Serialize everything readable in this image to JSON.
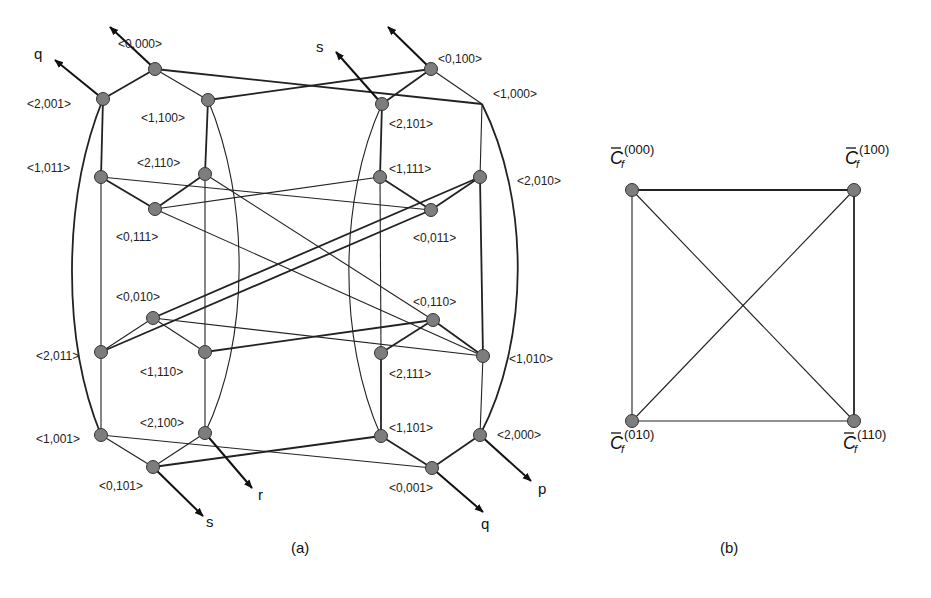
{
  "figure": {
    "panel_a": {
      "caption": "(a)",
      "nodes": [
        {
          "id": "n0000",
          "label": "<0,000>",
          "x": 155,
          "y": 69,
          "lx": 118,
          "ly": 48,
          "circle": true
        },
        {
          "id": "n0100",
          "label": "<0,100>",
          "x": 431,
          "y": 69,
          "lx": 438,
          "ly": 63,
          "circle": true
        },
        {
          "id": "n2001",
          "label": "<2,001>",
          "x": 103,
          "y": 99,
          "lx": 27,
          "ly": 108,
          "circle": true
        },
        {
          "id": "n1100",
          "label": "<1,100>",
          "x": 208,
          "y": 100,
          "lx": 141,
          "ly": 122,
          "circle": true
        },
        {
          "id": "n2101",
          "label": "<2,101>",
          "x": 382,
          "y": 104,
          "lx": 389,
          "ly": 128,
          "circle": true
        },
        {
          "id": "n1000",
          "label": "<1,000>",
          "x": 482,
          "y": 104,
          "lx": 493,
          "ly": 98,
          "circle": false
        },
        {
          "id": "n1011",
          "label": "<1,011>",
          "x": 101,
          "y": 177,
          "lx": 27,
          "ly": 172,
          "circle": true
        },
        {
          "id": "n2110",
          "label": "<2,110>",
          "x": 205,
          "y": 174,
          "lx": 137,
          "ly": 167,
          "circle": true
        },
        {
          "id": "n1111",
          "label": "<1,111>",
          "x": 380,
          "y": 177,
          "lx": 389,
          "ly": 173,
          "circle": true
        },
        {
          "id": "n2010",
          "label": "<2,010>",
          "x": 480,
          "y": 177,
          "lx": 517,
          "ly": 185,
          "circle": true
        },
        {
          "id": "n0111",
          "label": "<0,111>",
          "x": 155,
          "y": 209,
          "lx": 116,
          "ly": 241,
          "circle": true
        },
        {
          "id": "n0011",
          "label": "<0,011>",
          "x": 431,
          "y": 210,
          "lx": 413,
          "ly": 242,
          "circle": true
        },
        {
          "id": "n0010",
          "label": "<0,010>",
          "x": 153,
          "y": 318,
          "lx": 116,
          "ly": 301,
          "circle": true
        },
        {
          "id": "n0110",
          "label": "<0,110>",
          "x": 433,
          "y": 320,
          "lx": 413,
          "ly": 306,
          "circle": true
        },
        {
          "id": "n2011",
          "label": "<2,011>",
          "x": 101,
          "y": 352,
          "lx": 36,
          "ly": 360,
          "circle": true
        },
        {
          "id": "n1110",
          "label": "<1,110>",
          "x": 205,
          "y": 352,
          "lx": 140,
          "ly": 376,
          "circle": true
        },
        {
          "id": "n2111",
          "label": "<2,111>",
          "x": 381,
          "y": 353,
          "lx": 389,
          "ly": 378,
          "circle": true
        },
        {
          "id": "n1010",
          "label": "<1,010>",
          "x": 483,
          "y": 356,
          "lx": 509,
          "ly": 363,
          "circle": true
        },
        {
          "id": "n1001",
          "label": "<1,001>",
          "x": 101,
          "y": 435,
          "lx": 36,
          "ly": 443,
          "circle": true
        },
        {
          "id": "n2100",
          "label": "<2,100>",
          "x": 205,
          "y": 433,
          "lx": 140,
          "ly": 427,
          "circle": true
        },
        {
          "id": "n1101",
          "label": "<1,101>",
          "x": 381,
          "y": 436,
          "lx": 389,
          "ly": 432,
          "circle": true
        },
        {
          "id": "n2000",
          "label": "<2,000>",
          "x": 480,
          "y": 435,
          "lx": 497,
          "ly": 439,
          "circle": true
        },
        {
          "id": "n0101",
          "label": "<0,101>",
          "x": 153,
          "y": 467,
          "lx": 99,
          "ly": 490,
          "circle": true
        },
        {
          "id": "n0001",
          "label": "<0,001>",
          "x": 432,
          "y": 468,
          "lx": 389,
          "ly": 492,
          "circle": true
        }
      ],
      "edges": [
        [
          "n0000",
          "n2001",
          "thick"
        ],
        [
          "n0000",
          "n1100",
          "thin"
        ],
        [
          "n0000",
          "n1000",
          "thick"
        ],
        [
          "n0100",
          "n2101",
          "thick"
        ],
        [
          "n0100",
          "n1000",
          "thin"
        ],
        [
          "n0100",
          "n1100",
          "thick"
        ],
        [
          "n2001",
          "n1011",
          "thick"
        ],
        [
          "n1100",
          "n2110",
          "thick"
        ],
        [
          "n2101",
          "n1111",
          "thick"
        ],
        [
          "n1000",
          "n2010",
          "thin"
        ],
        [
          "n1011",
          "n0111",
          "thick"
        ],
        [
          "n2110",
          "n0111",
          "thick"
        ],
        [
          "n1011",
          "n0011",
          "thin"
        ],
        [
          "n0111",
          "n1111",
          "thin"
        ],
        [
          "n1111",
          "n0011",
          "thick"
        ],
        [
          "n2010",
          "n0011",
          "thick"
        ],
        [
          "n0111",
          "n1010",
          "thin"
        ],
        [
          "n2110",
          "n0110",
          "thin"
        ],
        [
          "n2010",
          "n0010",
          "thick"
        ],
        [
          "n0011",
          "n2011",
          "thick"
        ],
        [
          "n1011",
          "n2011",
          "thin"
        ],
        [
          "n2110",
          "n1110",
          "thin"
        ],
        [
          "n1111",
          "n2111",
          "thin"
        ],
        [
          "n2010",
          "n1010",
          "thick"
        ],
        [
          "n0010",
          "n2011",
          "thin"
        ],
        [
          "n0010",
          "n1110",
          "thin"
        ],
        [
          "n0010",
          "n1010",
          "thin"
        ],
        [
          "n1110",
          "n0110",
          "thick"
        ],
        [
          "n0110",
          "n2111",
          "thick"
        ],
        [
          "n0110",
          "n1010",
          "thick"
        ],
        [
          "n2011",
          "n1001",
          "thin"
        ],
        [
          "n1110",
          "n2100",
          "thin"
        ],
        [
          "n2111",
          "n1101",
          "thick"
        ],
        [
          "n1010",
          "n2000",
          "thin"
        ],
        [
          "n1001",
          "n0101",
          "thin"
        ],
        [
          "n2100",
          "n0101",
          "thin"
        ],
        [
          "n1001",
          "n0001",
          "thin"
        ],
        [
          "n0101",
          "n1101",
          "thick"
        ],
        [
          "n1101",
          "n0001",
          "thick"
        ],
        [
          "n2000",
          "n0001",
          "thick"
        ]
      ],
      "curves": [
        {
          "d": "M103,99 C62,200 62,340 101,435",
          "w": "thick"
        },
        {
          "d": "M208,100 C250,200 250,340 205,433",
          "w": "thin"
        },
        {
          "d": "M382,104 C338,200 338,340 381,436",
          "w": "thin"
        },
        {
          "d": "M482,104 C530,200 530,340 480,435",
          "w": "thick"
        }
      ],
      "arrows": [
        {
          "from": [
            155,
            69
          ],
          "to": [
            110,
            27
          ],
          "label": "",
          "lx": 0,
          "ly": 0
        },
        {
          "from": [
            103,
            99
          ],
          "to": [
            55,
            60
          ],
          "label": "q",
          "lx": 34,
          "ly": 59
        },
        {
          "from": [
            431,
            69
          ],
          "to": [
            388,
            27
          ],
          "label": "",
          "lx": 0,
          "ly": 0
        },
        {
          "from": [
            382,
            104
          ],
          "to": [
            336,
            52
          ],
          "label": "s",
          "lx": 316,
          "ly": 52
        },
        {
          "from": [
            205,
            433
          ],
          "to": [
            252,
            488
          ],
          "label": "r",
          "lx": 258,
          "ly": 500
        },
        {
          "from": [
            153,
            467
          ],
          "to": [
            203,
            516
          ],
          "label": "s",
          "lx": 206,
          "ly": 527
        },
        {
          "from": [
            432,
            468
          ],
          "to": [
            483,
            512
          ],
          "label": "q",
          "lx": 481,
          "ly": 529
        },
        {
          "from": [
            480,
            435
          ],
          "to": [
            531,
            481
          ],
          "label": "p",
          "lx": 538,
          "ly": 494
        }
      ]
    },
    "panel_b": {
      "caption": "(b)",
      "nodes": [
        {
          "id": "c000",
          "base": "C",
          "sub": "f",
          "sup": "(000)",
          "x": 632,
          "y": 190,
          "lx": 610,
          "ly": 164
        },
        {
          "id": "c100",
          "base": "C",
          "sub": "f",
          "sup": "(100)",
          "x": 854,
          "y": 190,
          "lx": 845,
          "ly": 164
        },
        {
          "id": "c010",
          "base": "C",
          "sub": "f",
          "sup": "(010)",
          "x": 632,
          "y": 421,
          "lx": 610,
          "ly": 449
        },
        {
          "id": "c110",
          "base": "C",
          "sub": "f",
          "sup": "(110)",
          "x": 854,
          "y": 421,
          "lx": 843,
          "ly": 449
        }
      ],
      "edges": [
        [
          "c000",
          "c100",
          "thick"
        ],
        [
          "c000",
          "c010",
          "thin"
        ],
        [
          "c100",
          "c110",
          "thick"
        ],
        [
          "c010",
          "c110",
          "thin"
        ],
        [
          "c000",
          "c110",
          "thin"
        ],
        [
          "c100",
          "c010",
          "thin"
        ]
      ]
    }
  }
}
